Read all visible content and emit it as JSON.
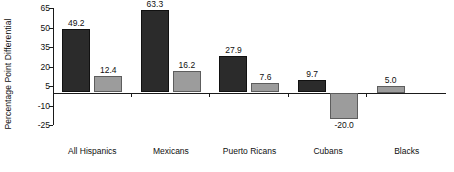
{
  "chart_data": {
    "type": "bar",
    "title": "",
    "subtitle": "",
    "xlabel": "",
    "ylabel": "Percentage Point Differential",
    "grid": false,
    "legend": "none",
    "ylim": [
      -25,
      65
    ],
    "yticks": [
      "65",
      "50",
      "35",
      "20",
      "5",
      "-10",
      "-25"
    ],
    "ytick_values": [
      65,
      50,
      35,
      20,
      5,
      -10,
      -25
    ],
    "categories": [
      "All Hispanics",
      "Mexicans",
      "Puerto Ricans",
      "Cubans",
      "Blacks"
    ],
    "series": [
      {
        "name": "dark",
        "color": "#2b2b2b",
        "values": [
          49.2,
          63.3,
          27.9,
          9.7,
          null
        ],
        "labels": [
          "49.2",
          "63.3",
          "27.9",
          "9.7",
          ""
        ]
      },
      {
        "name": "light",
        "color": "#9c9c9c",
        "values": [
          12.4,
          16.2,
          7.6,
          -20.0,
          5.0
        ],
        "labels": [
          "12.4",
          "16.2",
          "7.6",
          "-20.0",
          "5.0"
        ]
      }
    ]
  },
  "axis": {
    "y_title": "Percentage Point Differential"
  },
  "colors": {
    "dark_bar": "#2b2b2b",
    "light_bar": "#9c9c9c",
    "axis": "#1a1a1a",
    "text": "#101010",
    "background": "#ffffff"
  }
}
